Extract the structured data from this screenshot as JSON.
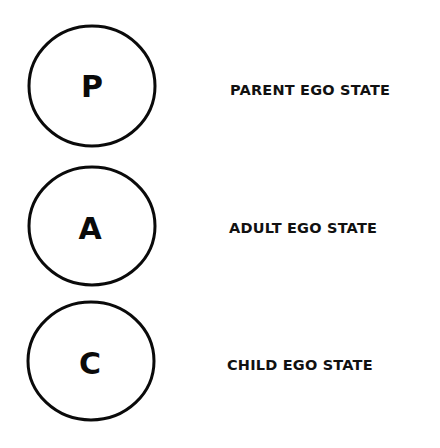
{
  "diagram": {
    "ego_states": [
      {
        "letter": "P",
        "label": "PARENT EGO STATE"
      },
      {
        "letter": "A",
        "label": "ADULT EGO STATE"
      },
      {
        "letter": "C",
        "label": "CHILD EGO STATE"
      }
    ],
    "colors": {
      "stroke": "#0a0a0a",
      "background": "#ffffff",
      "text": "#111111"
    }
  }
}
